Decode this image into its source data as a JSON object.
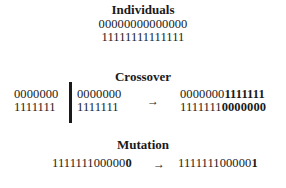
{
  "individuals": {
    "title": "Individuals",
    "rows": [
      "00000000000000",
      "11111111111111"
    ]
  },
  "crossover": {
    "title": "Crossover",
    "parents_left": [
      "0000000",
      "1111111"
    ],
    "parents_right": [
      "0000000",
      "1111111"
    ],
    "arrow": "→",
    "children": [
      {
        "plain": "0000000",
        "bold": "1111111"
      },
      {
        "plain": "1111111",
        "bold": "0000000"
      }
    ]
  },
  "mutation": {
    "title": "Mutation",
    "before": {
      "plain": "111111100000",
      "bold": "0"
    },
    "arrow": "→",
    "after": {
      "plain": "111111100000",
      "bold": "1"
    }
  }
}
